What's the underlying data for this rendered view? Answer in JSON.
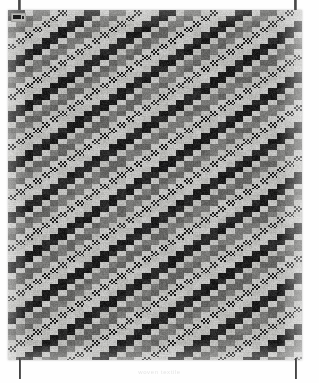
{
  "scene": {
    "width": 319,
    "height": 383,
    "background_color": "#fefefe",
    "subject": "woven-textile-panel"
  },
  "panel": {
    "label": "woven textile panel",
    "x": 8,
    "y": 10,
    "width": 294,
    "height": 350,
    "base_color": "#c7c7c5",
    "edge_shadow_color": "#9a9a98"
  },
  "corner_tag": {
    "label": "inventory tag",
    "x": 3,
    "y": 3,
    "width": 13,
    "height": 7,
    "tag_color": "#b9b9b6",
    "mark_color": "#1d1d1d"
  },
  "rods": [
    {
      "name": "top-left-rod",
      "x": 18,
      "y": 0,
      "width": 3,
      "height": 13,
      "color": "#3a3a3a"
    },
    {
      "name": "top-right-rod",
      "x": 294,
      "y": 0,
      "width": 3,
      "height": 13,
      "color": "#3a3a3a"
    },
    {
      "name": "bottom-left-rod",
      "x": 19,
      "y": 358,
      "width": 2,
      "height": 21,
      "color": "#2e2e2e"
    },
    {
      "name": "bottom-right-rod",
      "x": 295,
      "y": 358,
      "width": 2,
      "height": 21,
      "color": "#2e2e2e"
    }
  ],
  "caption": {
    "text": "woven textile",
    "color": "#e4e4e4",
    "font_size": 6
  },
  "weave": {
    "description": "stepped diagonal twill; bands run lower-left to upper-right",
    "cell_width": 8.4,
    "cell_height": 5.6,
    "columns": 35,
    "rows": 63,
    "step_per_row": 1,
    "band_period": 9,
    "palette": {
      "light": "#c6c6c4",
      "light_alt": "#bdbdba",
      "mid": "#7c7c7a",
      "mid_dark": "#666664",
      "dark": "#1c1c1c",
      "dark_soft": "#2b2b2b"
    },
    "band_sequence": [
      {
        "tone": "dark",
        "width": 2,
        "texture": "solid"
      },
      {
        "tone": "light",
        "width": 1,
        "texture": "solid"
      },
      {
        "tone": "mid",
        "width": 2,
        "texture": "solid"
      },
      {
        "tone": "light",
        "width": 1,
        "texture": "solid"
      },
      {
        "tone": "dark",
        "width": 1,
        "texture": "dither"
      },
      {
        "tone": "light",
        "width": 2,
        "texture": "solid"
      }
    ],
    "dither_bands": [
      4,
      13,
      22,
      31
    ],
    "dither_strength": 0.55,
    "noise_amount": 0.1
  }
}
